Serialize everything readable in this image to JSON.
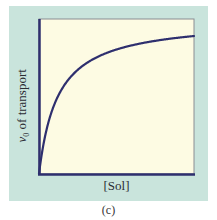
{
  "figure": {
    "panel_color": "#c9e4dc",
    "plot_fill": "#fdfbe3",
    "curve_color": "#2e2f6e",
    "caption": "(c)"
  },
  "chart_data": {
    "type": "line",
    "title": "",
    "xlabel": "[Sol]",
    "ylabel_main": "v",
    "ylabel_sub": "0",
    "ylabel_rest": " of transport",
    "ylabel": "v0 of transport",
    "grid": false,
    "legend": null,
    "x_ticks": [],
    "y_ticks": [],
    "xlim": [
      0,
      155
    ],
    "ylim": [
      0,
      155
    ],
    "model": "hyperbolic saturation v = Vmax*S/(K+S)",
    "Vmax": 154.7,
    "K": 18.8,
    "series": [
      {
        "name": "v0",
        "x": [
          0,
          5,
          10,
          21,
          39,
          60,
          79,
          100,
          120,
          140,
          155
        ],
        "y": [
          0,
          32.5,
          53.7,
          81.6,
          104.4,
          117.8,
          125.0,
          130.2,
          133.7,
          136.4,
          138.0
        ]
      }
    ]
  }
}
